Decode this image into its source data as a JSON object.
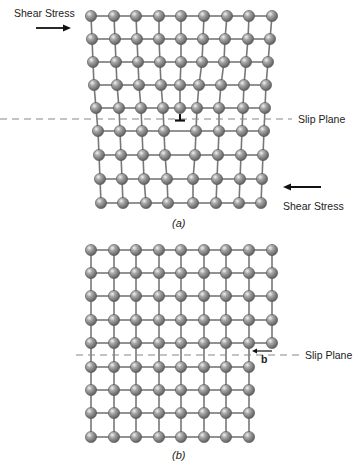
{
  "figure_a": {
    "caption": "(a)",
    "caption_letter": "a",
    "top_label_stress": "Shear Stress",
    "bottom_label_stress": "Shear Stress",
    "slip_plane_label": "Slip Plane",
    "slip_plane_y": 119,
    "dislocation_symbol": "⊥",
    "dislocation_x": 180,
    "upper_rows": [
      {
        "y": 16,
        "xs": [
          91,
          114,
          136,
          159,
          181,
          204,
          227,
          249,
          272
        ]
      },
      {
        "y": 39,
        "xs": [
          92,
          115,
          137,
          159,
          181,
          203,
          225,
          248,
          270
        ]
      },
      {
        "y": 62,
        "xs": [
          93,
          116,
          138,
          160,
          181,
          202,
          224,
          246,
          268
        ]
      },
      {
        "y": 85,
        "xs": [
          94,
          117,
          139,
          161,
          180,
          199,
          221,
          244,
          266
        ]
      },
      {
        "y": 108,
        "xs": [
          96,
          119,
          141,
          163,
          180,
          197,
          219,
          243,
          265
        ]
      }
    ],
    "lower_rows": [
      {
        "y": 131,
        "xs": [
          98,
          120,
          142,
          164,
          196,
          219,
          242,
          264
        ]
      },
      {
        "y": 155,
        "xs": [
          99,
          121,
          143,
          165,
          195,
          218,
          241,
          263
        ]
      },
      {
        "y": 179,
        "xs": [
          100,
          122,
          144,
          167,
          193,
          217,
          240,
          262
        ]
      },
      {
        "y": 203,
        "xs": [
          101,
          123,
          146,
          168,
          193,
          216,
          239,
          261
        ]
      }
    ],
    "extra_half_plane_index": 4
  },
  "figure_b": {
    "caption": "(b)",
    "caption_letter": "b",
    "slip_plane_label": "Slip Plane",
    "burgers_vector_label": "b",
    "slip_plane_y": 355,
    "upper_rows": [
      {
        "y": 250,
        "xs": [
          91,
          114,
          136,
          159,
          181,
          204,
          226,
          249,
          272
        ]
      },
      {
        "y": 273,
        "xs": [
          91,
          114,
          136,
          159,
          181,
          204,
          226,
          249,
          272
        ]
      },
      {
        "y": 296,
        "xs": [
          91,
          114,
          136,
          159,
          181,
          204,
          226,
          249,
          272
        ]
      },
      {
        "y": 320,
        "xs": [
          91,
          114,
          136,
          159,
          181,
          204,
          226,
          249,
          272
        ]
      },
      {
        "y": 343,
        "xs": [
          91,
          114,
          136,
          159,
          181,
          204,
          226,
          249,
          272
        ]
      }
    ],
    "lower_rows": [
      {
        "y": 367,
        "xs": [
          91,
          114,
          136,
          159,
          181,
          204,
          226,
          249
        ]
      },
      {
        "y": 390,
        "xs": [
          91,
          114,
          136,
          159,
          181,
          204,
          226,
          249
        ]
      },
      {
        "y": 413,
        "xs": [
          91,
          114,
          136,
          159,
          181,
          204,
          226,
          249
        ]
      },
      {
        "y": 437,
        "xs": [
          91,
          114,
          136,
          159,
          181,
          204,
          226,
          249
        ]
      }
    ]
  },
  "colors": {
    "atom_fill": "#8a8a8a",
    "atom_highlight": "#e6e6e6",
    "atom_stroke": "#555555",
    "bond": "#777777",
    "arrow": "#111111",
    "text": "#222222"
  }
}
